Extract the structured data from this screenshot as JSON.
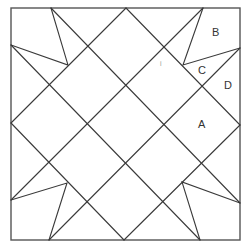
{
  "diagram": {
    "type": "quilt-block",
    "frame": {
      "x1": 11,
      "y1": 8,
      "x2": 240,
      "y2": 240
    },
    "lines": [
      {
        "x1": 11,
        "y1": 123,
        "x2": 126,
        "y2": 8
      },
      {
        "x1": 126,
        "y1": 8,
        "x2": 240,
        "y2": 125
      },
      {
        "x1": 240,
        "y1": 125,
        "x2": 124,
        "y2": 240
      },
      {
        "x1": 124,
        "y1": 240,
        "x2": 11,
        "y2": 123
      },
      {
        "x1": 51,
        "y1": 8,
        "x2": 240,
        "y2": 203
      },
      {
        "x1": 203,
        "y1": 8,
        "x2": 11,
        "y2": 200
      },
      {
        "x1": 11,
        "y1": 45,
        "x2": 200,
        "y2": 240
      },
      {
        "x1": 240,
        "y1": 48,
        "x2": 49,
        "y2": 240
      }
    ],
    "triangles": [
      {
        "points": "51,8 68,65 11,45"
      },
      {
        "points": "203,8 183,65 240,48"
      },
      {
        "points": "11,200 67,183 49,240"
      },
      {
        "points": "240,203 182,182 200,240"
      }
    ],
    "labels": [
      {
        "text": "A",
        "x": 198,
        "y": 128
      },
      {
        "text": "B",
        "x": 212,
        "y": 36
      },
      {
        "text": "C",
        "x": 198,
        "y": 74
      },
      {
        "text": "D",
        "x": 224,
        "y": 89
      }
    ],
    "marks": [
      {
        "text": "i",
        "x": 160,
        "y": 66
      }
    ]
  }
}
